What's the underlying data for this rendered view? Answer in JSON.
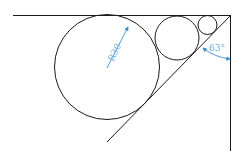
{
  "diagram": {
    "type": "geometry-construction",
    "radius_label": "R30",
    "angle_label": "63°",
    "colors": {
      "line": "#1a1a1a",
      "annotation": "#6aaee0",
      "background": "#ffffff"
    }
  }
}
